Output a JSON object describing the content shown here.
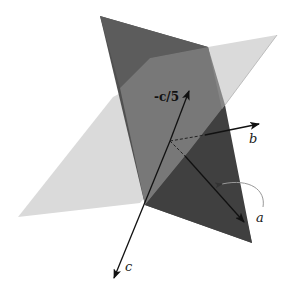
{
  "diagram": {
    "type": "3d-planes-with-axes",
    "colors": {
      "background": "#ffffff",
      "light_plane": "#d6d6d6",
      "dark_plane": "#4a4a4a",
      "overlap_region": "#7a7a7a",
      "upper_facet": "#666666",
      "axis_line": "#111111",
      "rotation_arc": "#9a9a9a"
    },
    "labels": {
      "neg_c_over_5": "-c/5",
      "b": "b",
      "a": "a",
      "c": "c"
    },
    "axes": [
      {
        "name": "c",
        "direction": "down-left",
        "style": "solid"
      },
      {
        "name": "-c/5",
        "direction": "up",
        "style": "solid"
      },
      {
        "name": "b",
        "direction": "right",
        "style": "solid-with-dashed-hidden-part"
      },
      {
        "name": "a",
        "direction": "down-right",
        "style": "solid-with-dashed-hidden-part",
        "rotation_arc": true
      }
    ]
  }
}
